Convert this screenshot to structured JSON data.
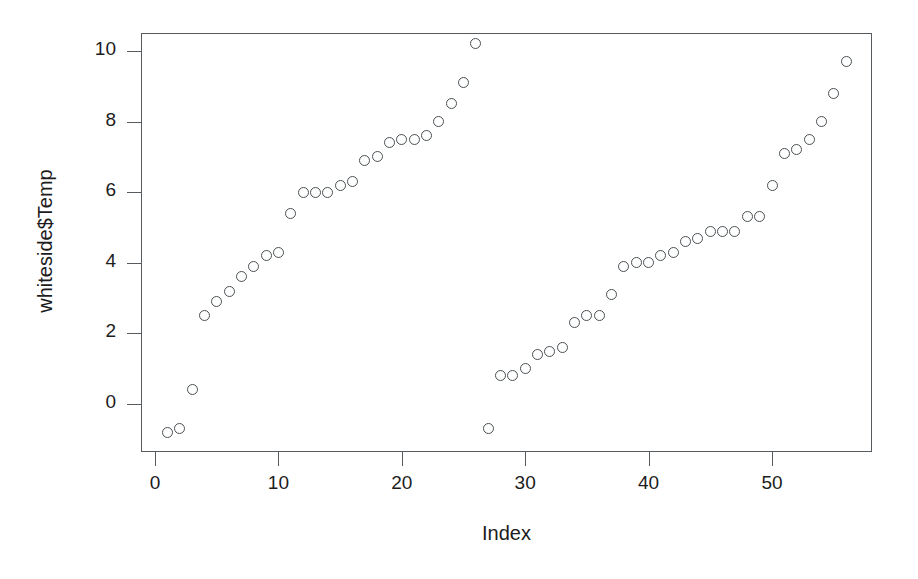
{
  "chart_data": {
    "type": "scatter",
    "title": "",
    "xlabel": "Index",
    "ylabel": "whiteside$Temp",
    "xlim": [
      0.5,
      57.0
    ],
    "ylim": [
      -1.35,
      10.6
    ],
    "grid": false,
    "legend": null,
    "point_marker": "open-circle",
    "point_color": "#4a5054",
    "xticks": [
      0,
      10,
      20,
      30,
      40,
      50
    ],
    "xtick_labels": [
      "0",
      "10",
      "20",
      "30",
      "40",
      "50"
    ],
    "yticks": [
      0,
      2,
      4,
      6,
      8,
      10
    ],
    "ytick_labels": [
      "0",
      "2",
      "4",
      "6",
      "8",
      "10"
    ],
    "n_points": 56,
    "x": [
      1,
      2,
      3,
      4,
      5,
      6,
      7,
      8,
      9,
      10,
      11,
      12,
      13,
      14,
      15,
      16,
      17,
      18,
      19,
      20,
      21,
      22,
      23,
      24,
      25,
      26,
      27,
      28,
      29,
      30,
      31,
      32,
      33,
      34,
      35,
      36,
      37,
      38,
      39,
      40,
      41,
      42,
      43,
      44,
      45,
      46,
      47,
      48,
      49,
      50,
      51,
      52,
      53,
      54,
      55,
      56
    ],
    "y": [
      -0.8,
      -0.7,
      0.4,
      2.5,
      2.9,
      3.2,
      3.6,
      3.9,
      4.2,
      4.3,
      5.4,
      6.0,
      6.0,
      6.0,
      6.2,
      6.3,
      6.9,
      7.0,
      7.4,
      7.5,
      7.5,
      7.6,
      8.0,
      8.5,
      9.1,
      10.2,
      -0.7,
      0.8,
      0.8,
      1.0,
      1.4,
      1.5,
      1.6,
      2.3,
      2.5,
      2.5,
      3.1,
      3.9,
      4.0,
      4.0,
      4.2,
      4.3,
      4.6,
      4.7,
      4.9,
      4.9,
      4.9,
      5.3,
      5.3,
      6.2,
      7.1,
      7.2,
      7.5,
      8.0,
      8.8,
      9.7
    ],
    "clusters": [
      {
        "name": "group-1",
        "index_range": [
          1,
          26
        ]
      },
      {
        "name": "group-2",
        "index_range": [
          27,
          56
        ]
      }
    ]
  },
  "axes": {
    "x_title": "Index",
    "y_title": "whiteside$Temp"
  }
}
